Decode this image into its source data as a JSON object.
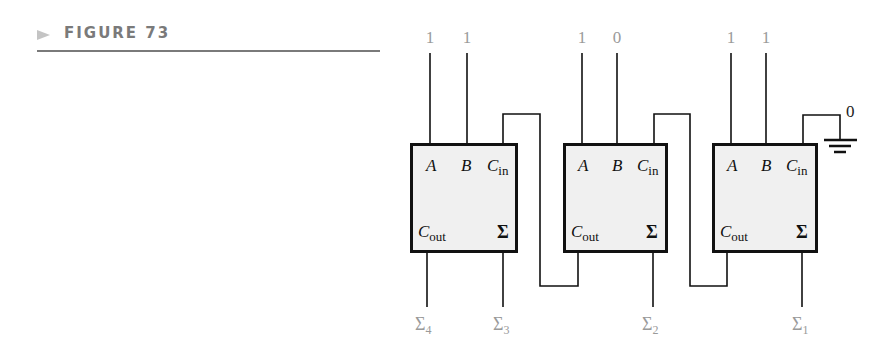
{
  "figure": {
    "label": "FIGURE 73"
  },
  "diagram": {
    "type": "4-bit parallel adder from 3 full adders",
    "inputs": [
      {
        "value": "1",
        "x": 430
      },
      {
        "value": "1",
        "x": 467
      },
      {
        "value": "1",
        "x": 582
      },
      {
        "value": "0",
        "x": 617
      },
      {
        "value": "1",
        "x": 731
      },
      {
        "value": "1",
        "x": 766
      }
    ],
    "adders": [
      {
        "pin_a": "A",
        "pin_b": "B",
        "pin_cin": "C",
        "pin_cin_sub": "in",
        "pin_cout": "C",
        "pin_cout_sub": "out",
        "pin_sum": "Σ"
      },
      {
        "pin_a": "A",
        "pin_b": "B",
        "pin_cin": "C",
        "pin_cin_sub": "in",
        "pin_cout": "C",
        "pin_cout_sub": "out",
        "pin_sum": "Σ"
      },
      {
        "pin_a": "A",
        "pin_b": "B",
        "pin_cin": "C",
        "pin_cin_sub": "in",
        "pin_cout": "C",
        "pin_cout_sub": "out",
        "pin_sum": "Σ"
      }
    ],
    "carry_in_ground_label": "0",
    "outputs": [
      {
        "symbol": "Σ",
        "sub": "4"
      },
      {
        "symbol": "Σ",
        "sub": "3"
      },
      {
        "symbol": "Σ",
        "sub": "2"
      },
      {
        "symbol": "Σ",
        "sub": "1"
      }
    ]
  }
}
